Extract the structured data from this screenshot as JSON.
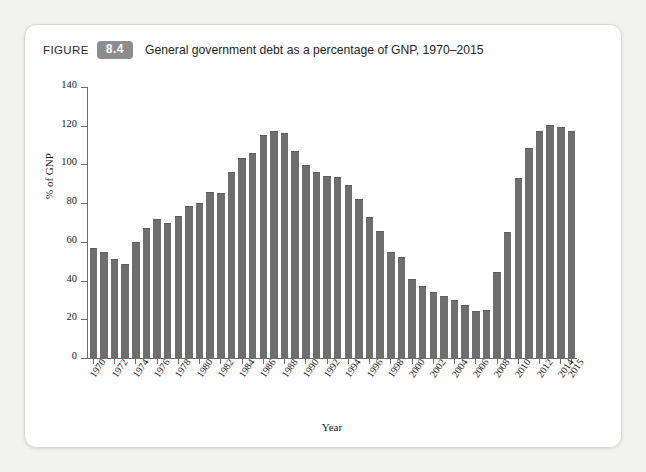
{
  "figure": {
    "label_word": "FIGURE",
    "number": "8.4",
    "title": "General government debt as a percentage of GNP, 1970–2015"
  },
  "chart_data": {
    "type": "bar",
    "title": "General government debt as a percentage of GNP, 1970–2015",
    "xlabel": "Year",
    "ylabel": "% of GNP",
    "ylim": [
      0,
      140
    ],
    "yticks": [
      0,
      20,
      40,
      60,
      80,
      100,
      120,
      140
    ],
    "grid": false,
    "legend": null,
    "bar_color": "#6e6e6e",
    "categories": [
      "1970",
      "1971",
      "1972",
      "1973",
      "1974",
      "1975",
      "1976",
      "1977",
      "1978",
      "1979",
      "1980",
      "1981",
      "1982",
      "1983",
      "1984",
      "1985",
      "1986",
      "1987",
      "1988",
      "1989",
      "1990",
      "1991",
      "1992",
      "1993",
      "1994",
      "1995",
      "1996",
      "1997",
      "1998",
      "1999",
      "2000",
      "2001",
      "2002",
      "2003",
      "2004",
      "2005",
      "2006",
      "2007",
      "2008",
      "2009",
      "2010",
      "2011",
      "2012",
      "2013",
      "2014",
      "2015"
    ],
    "tick_labels": [
      "1970",
      "",
      "1972",
      "",
      "1974",
      "",
      "1976",
      "",
      "1978",
      "",
      "1980",
      "",
      "1982",
      "",
      "1984",
      "",
      "1986",
      "",
      "1988",
      "",
      "1990",
      "",
      "1992",
      "",
      "1994",
      "",
      "1996",
      "",
      "1998",
      "",
      "2000",
      "",
      "2002",
      "",
      "2004",
      "",
      "2006",
      "",
      "2008",
      "",
      "2010",
      "",
      "2012",
      "",
      "2014",
      "2015"
    ],
    "values": [
      57,
      55,
      51,
      48.5,
      60,
      67,
      72,
      70,
      73.5,
      78.5,
      80,
      86,
      85,
      96,
      103.5,
      106,
      115,
      117.5,
      116.5,
      107,
      99.5,
      96,
      94,
      93.5,
      89.5,
      82,
      73,
      65.5,
      55,
      52,
      41,
      37,
      34,
      32,
      30,
      27.5,
      24.5,
      25,
      44.5,
      65,
      93,
      108.5,
      117.5,
      120.5,
      119.5,
      117.5
    ]
  },
  "ylabel_text": "% of GNP",
  "xlabel_text": "Year"
}
